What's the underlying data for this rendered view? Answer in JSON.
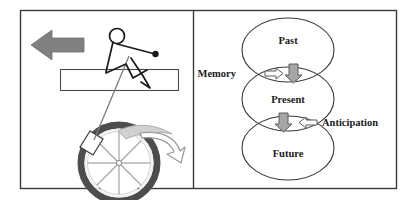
{
  "figure": {
    "name": "two-panel-figure",
    "panels": 2,
    "frame_color": "#3a3a3a",
    "background": "#ffffff"
  },
  "left_panel": {
    "name": "cyclist-panel",
    "direction_arrow": {
      "icon": "left-arrow-icon",
      "label": "",
      "color": "#808080",
      "direction": "left"
    },
    "rider": {
      "icon": "stick-figure-cyclist-icon",
      "color": "#1a1a1a"
    },
    "bar": {
      "icon": "horizontal-bar-icon",
      "color": "#4a4a4a"
    },
    "wheel": {
      "icon": "bicycle-wheel-icon",
      "tire_color": "#4d4d4d",
      "rim_color": "#ffffff",
      "spoke_color": "#9a9a9a"
    },
    "fender": {
      "icon": "fender-icon",
      "color": "#b3b3b3"
    },
    "rotation_arrow": {
      "icon": "curved-arrow-icon",
      "color": "#9a9a9a"
    },
    "pedal": {
      "icon": "pedal-icon",
      "color": "#333333"
    }
  },
  "right_panel": {
    "name": "time-ellipses-panel",
    "ellipses": [
      {
        "label": "Past",
        "name": "ellipse-past"
      },
      {
        "label": "Present",
        "name": "ellipse-present"
      },
      {
        "label": "Future",
        "name": "ellipse-future"
      }
    ],
    "side_labels": [
      {
        "label": "Memory",
        "name": "label-memory",
        "side": "left"
      },
      {
        "label": "Anticipation",
        "name": "label-anticipation",
        "side": "right"
      }
    ],
    "intersection_arrows": [
      {
        "name": "memory-intersection",
        "hollow_arrow": {
          "icon": "hollow-right-arrow-icon",
          "direction": "right",
          "color": "#ffffff",
          "stroke": "#5a5a5a"
        },
        "solid_arrow": {
          "icon": "solid-down-arrow-icon",
          "direction": "down",
          "color": "#a6a6a6",
          "stroke": "#5a5a5a"
        }
      },
      {
        "name": "anticipation-intersection",
        "solid_arrow": {
          "icon": "solid-down-arrow-icon",
          "direction": "down",
          "color": "#a6a6a6",
          "stroke": "#5a5a5a"
        },
        "hollow_arrow": {
          "icon": "hollow-left-arrow-icon",
          "direction": "left",
          "color": "#ffffff",
          "stroke": "#5a5a5a"
        }
      }
    ],
    "ellipse_stroke": "#3a3a3a"
  }
}
